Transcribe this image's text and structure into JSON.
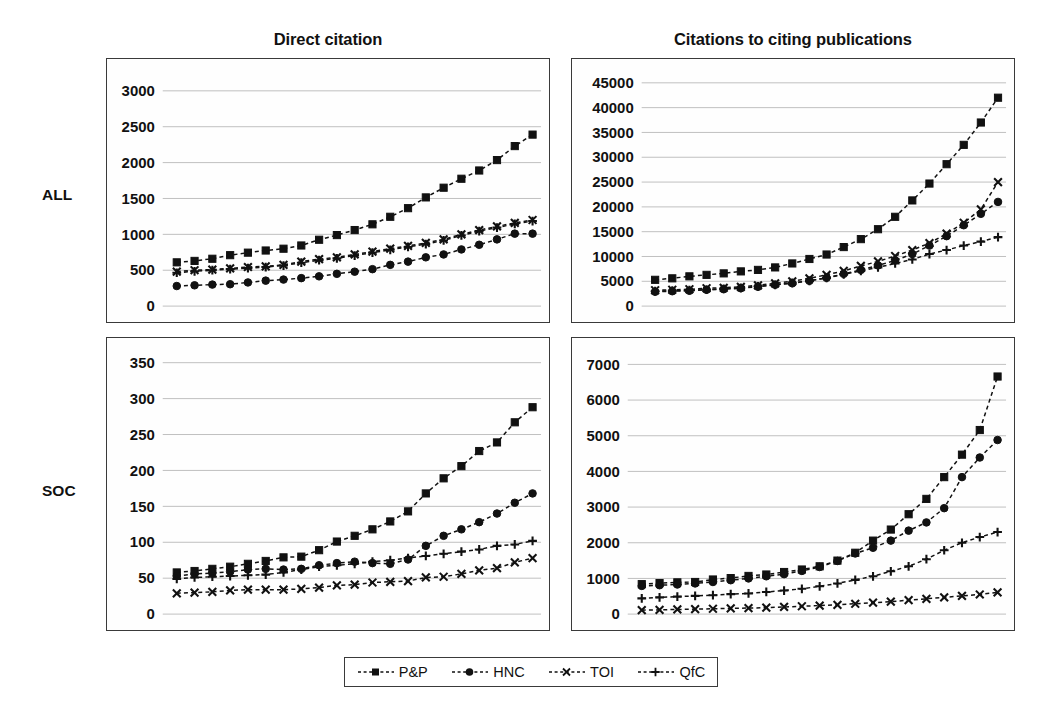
{
  "figure": {
    "column_titles": [
      "Direct citation",
      "Citations to citing publications"
    ],
    "row_labels": [
      "ALL",
      "SOC"
    ]
  },
  "legend": {
    "position": "bottom-center",
    "items": [
      {
        "label": "P&P",
        "marker": "square-marker"
      },
      {
        "label": "HNC",
        "marker": "circle-marker"
      },
      {
        "label": "TOI",
        "marker": "x-marker"
      },
      {
        "label": "QfC",
        "marker": "plus-marker"
      }
    ]
  },
  "chart_data": [
    {
      "panel": "ALL / Direct citation",
      "row": "ALL",
      "column": "Direct citation",
      "type": "line",
      "title": "Direct citation",
      "xlabel": "",
      "ylabel": "",
      "ylim": [
        0,
        3250
      ],
      "ytick_labels": [
        "0",
        "500",
        "1000",
        "1500",
        "2000",
        "2500",
        "3000"
      ],
      "yticks": [
        0,
        500,
        1000,
        1500,
        2000,
        2500,
        3000
      ],
      "grid": true,
      "n_points": 21,
      "x": [
        1,
        2,
        3,
        4,
        5,
        6,
        7,
        8,
        9,
        10,
        11,
        12,
        13,
        14,
        15,
        16,
        17,
        18,
        19,
        20,
        21
      ],
      "series": [
        {
          "name": "P&P",
          "marker": "square-marker",
          "values": [
            610,
            630,
            660,
            710,
            745,
            775,
            800,
            845,
            925,
            990,
            1060,
            1140,
            1245,
            1365,
            1515,
            1650,
            1775,
            1890,
            2035,
            2230,
            2390
          ]
        },
        {
          "name": "HNC",
          "marker": "circle-marker",
          "values": [
            280,
            290,
            300,
            305,
            330,
            355,
            370,
            390,
            415,
            450,
            480,
            515,
            575,
            620,
            680,
            720,
            790,
            855,
            930,
            1010,
            1010
          ]
        },
        {
          "name": "TOI",
          "marker": "x-marker",
          "values": [
            480,
            500,
            510,
            525,
            545,
            555,
            575,
            620,
            655,
            680,
            720,
            760,
            800,
            840,
            880,
            930,
            1000,
            1060,
            1110,
            1160,
            1200
          ]
        },
        {
          "name": "QfC",
          "marker": "plus-marker",
          "values": [
            465,
            485,
            500,
            515,
            530,
            545,
            565,
            605,
            640,
            665,
            705,
            745,
            785,
            825,
            865,
            915,
            985,
            1045,
            1095,
            1145,
            1185
          ]
        }
      ]
    },
    {
      "panel": "ALL / Citations to citing publications",
      "row": "ALL",
      "column": "Citations to citing publications",
      "type": "line",
      "title": "Citations to citing publications",
      "xlabel": "",
      "ylabel": "",
      "ylim": [
        0,
        47000
      ],
      "ytick_labels": [
        "0",
        "5000",
        "10000",
        "15000",
        "20000",
        "25000",
        "30000",
        "35000",
        "40000",
        "45000"
      ],
      "yticks": [
        0,
        5000,
        10000,
        15000,
        20000,
        25000,
        30000,
        35000,
        40000,
        45000
      ],
      "grid": true,
      "n_points": 21,
      "x": [
        1,
        2,
        3,
        4,
        5,
        6,
        7,
        8,
        9,
        10,
        11,
        12,
        13,
        14,
        15,
        16,
        17,
        18,
        19,
        20,
        21
      ],
      "series": [
        {
          "name": "P&P",
          "marker": "square-marker",
          "values": [
            5300,
            5600,
            6000,
            6300,
            6600,
            7000,
            7300,
            7800,
            8600,
            9500,
            10400,
            11900,
            13500,
            15500,
            18000,
            21300,
            24700,
            28600,
            32500,
            37000,
            42000
          ]
        },
        {
          "name": "HNC",
          "marker": "circle-marker",
          "values": [
            2900,
            3000,
            3100,
            3300,
            3400,
            3600,
            3900,
            4300,
            4600,
            5100,
            5700,
            6500,
            7300,
            8200,
            9200,
            10500,
            12200,
            14100,
            16300,
            18600,
            21000
          ]
        },
        {
          "name": "TOI",
          "marker": "x-marker",
          "values": [
            3200,
            3300,
            3400,
            3600,
            3700,
            3900,
            4200,
            4600,
            5000,
            5600,
            6300,
            7100,
            8100,
            9000,
            10100,
            11300,
            12700,
            14600,
            16800,
            19500,
            25000
          ]
        },
        {
          "name": "QfC",
          "marker": "plus-marker",
          "values": [
            3000,
            3100,
            3200,
            3300,
            3500,
            3700,
            4000,
            4300,
            4700,
            5100,
            5700,
            6400,
            7100,
            7800,
            8600,
            9400,
            10500,
            11300,
            12200,
            13000,
            13900
          ]
        }
      ]
    },
    {
      "panel": "SOC / Direct citation",
      "row": "SOC",
      "column": "Direct citation",
      "type": "line",
      "title": "Direct citation",
      "xlabel": "",
      "ylabel": "",
      "ylim": [
        0,
        365
      ],
      "ytick_labels": [
        "0",
        "50",
        "100",
        "150",
        "200",
        "250",
        "300",
        "350"
      ],
      "yticks": [
        0,
        50,
        100,
        150,
        200,
        250,
        300,
        350
      ],
      "grid": true,
      "n_points": 21,
      "x": [
        1,
        2,
        3,
        4,
        5,
        6,
        7,
        8,
        9,
        10,
        11,
        12,
        13,
        14,
        15,
        16,
        17,
        18,
        19,
        20,
        21
      ],
      "series": [
        {
          "name": "P&P",
          "marker": "square-marker",
          "values": [
            58,
            60,
            63,
            66,
            70,
            74,
            79,
            80,
            89,
            101,
            109,
            118,
            129,
            143,
            168,
            189,
            206,
            227,
            239,
            267,
            288
          ]
        },
        {
          "name": "HNC",
          "marker": "circle-marker",
          "values": [
            53,
            56,
            57,
            59,
            62,
            63,
            62,
            63,
            68,
            71,
            73,
            71,
            70,
            76,
            95,
            109,
            118,
            128,
            140,
            155,
            168
          ]
        },
        {
          "name": "TOI",
          "marker": "x-marker",
          "values": [
            29,
            30,
            31,
            33,
            34,
            34,
            34,
            35,
            37,
            40,
            41,
            44,
            45,
            46,
            51,
            52,
            56,
            61,
            64,
            72,
            78
          ]
        },
        {
          "name": "QfC",
          "marker": "plus-marker",
          "values": [
            49,
            51,
            52,
            53,
            54,
            55,
            58,
            62,
            66,
            68,
            70,
            73,
            75,
            78,
            81,
            84,
            87,
            90,
            95,
            97,
            102
          ]
        }
      ]
    },
    {
      "panel": "SOC / Citations to citing publications",
      "row": "SOC",
      "column": "Citations to citing publications",
      "type": "line",
      "title": "Citations to citing publications",
      "xlabel": "",
      "ylabel": "",
      "ylim": [
        0,
        7350
      ],
      "ytick_labels": [
        "0",
        "1000",
        "2000",
        "3000",
        "4000",
        "5000",
        "6000",
        "7000"
      ],
      "yticks": [
        0,
        1000,
        2000,
        3000,
        4000,
        5000,
        6000,
        7000
      ],
      "grid": true,
      "n_points": 21,
      "x": [
        1,
        2,
        3,
        4,
        5,
        6,
        7,
        8,
        9,
        10,
        11,
        12,
        13,
        14,
        15,
        16,
        17,
        18,
        19,
        20,
        21
      ],
      "series": [
        {
          "name": "P&P",
          "marker": "square-marker",
          "values": [
            840,
            870,
            890,
            900,
            970,
            1010,
            1070,
            1110,
            1180,
            1250,
            1340,
            1500,
            1720,
            2060,
            2370,
            2800,
            3230,
            3840,
            4470,
            5160,
            6660
          ]
        },
        {
          "name": "HNC",
          "marker": "circle-marker",
          "values": [
            790,
            810,
            830,
            860,
            900,
            950,
            1000,
            1060,
            1120,
            1210,
            1320,
            1490,
            1700,
            1860,
            2060,
            2340,
            2570,
            2970,
            3840,
            4390,
            4880
          ]
        },
        {
          "name": "TOI",
          "marker": "x-marker",
          "values": [
            110,
            120,
            130,
            140,
            150,
            160,
            170,
            180,
            200,
            220,
            240,
            260,
            290,
            320,
            350,
            390,
            430,
            470,
            510,
            550,
            610
          ]
        },
        {
          "name": "QfC",
          "marker": "plus-marker",
          "values": [
            440,
            470,
            490,
            510,
            530,
            560,
            580,
            620,
            660,
            710,
            780,
            860,
            960,
            1060,
            1200,
            1340,
            1540,
            1790,
            2000,
            2160,
            2300
          ]
        }
      ]
    }
  ]
}
